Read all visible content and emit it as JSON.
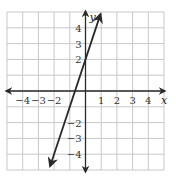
{
  "chart_data": {
    "type": "line",
    "title": "",
    "xlabel": "x",
    "ylabel": "y",
    "xlim": [
      -5,
      5
    ],
    "ylim": [
      -5,
      5
    ],
    "grid": true,
    "x_ticks": [
      -4,
      -3,
      -2,
      1,
      2,
      3,
      4
    ],
    "y_ticks": [
      4,
      3,
      2,
      -2,
      -3,
      -4
    ],
    "x_tick_labels": [
      "−4",
      "−3",
      "−2",
      "1",
      "2",
      "3",
      "4"
    ],
    "y_tick_labels": [
      "4",
      "3",
      "2",
      "−2",
      "−3",
      "−4"
    ],
    "series": [
      {
        "name": "y = 3x + 2",
        "slope": 3,
        "intercept": 2,
        "x": [
          -2.25,
          0.95
        ],
        "y": [
          -4.75,
          4.85
        ],
        "arrows": "both"
      }
    ]
  },
  "colors": {
    "grid": "#c8c8c8",
    "axis": "#2a2a2a",
    "line": "#2a2a2a",
    "background": "#ffffff"
  }
}
